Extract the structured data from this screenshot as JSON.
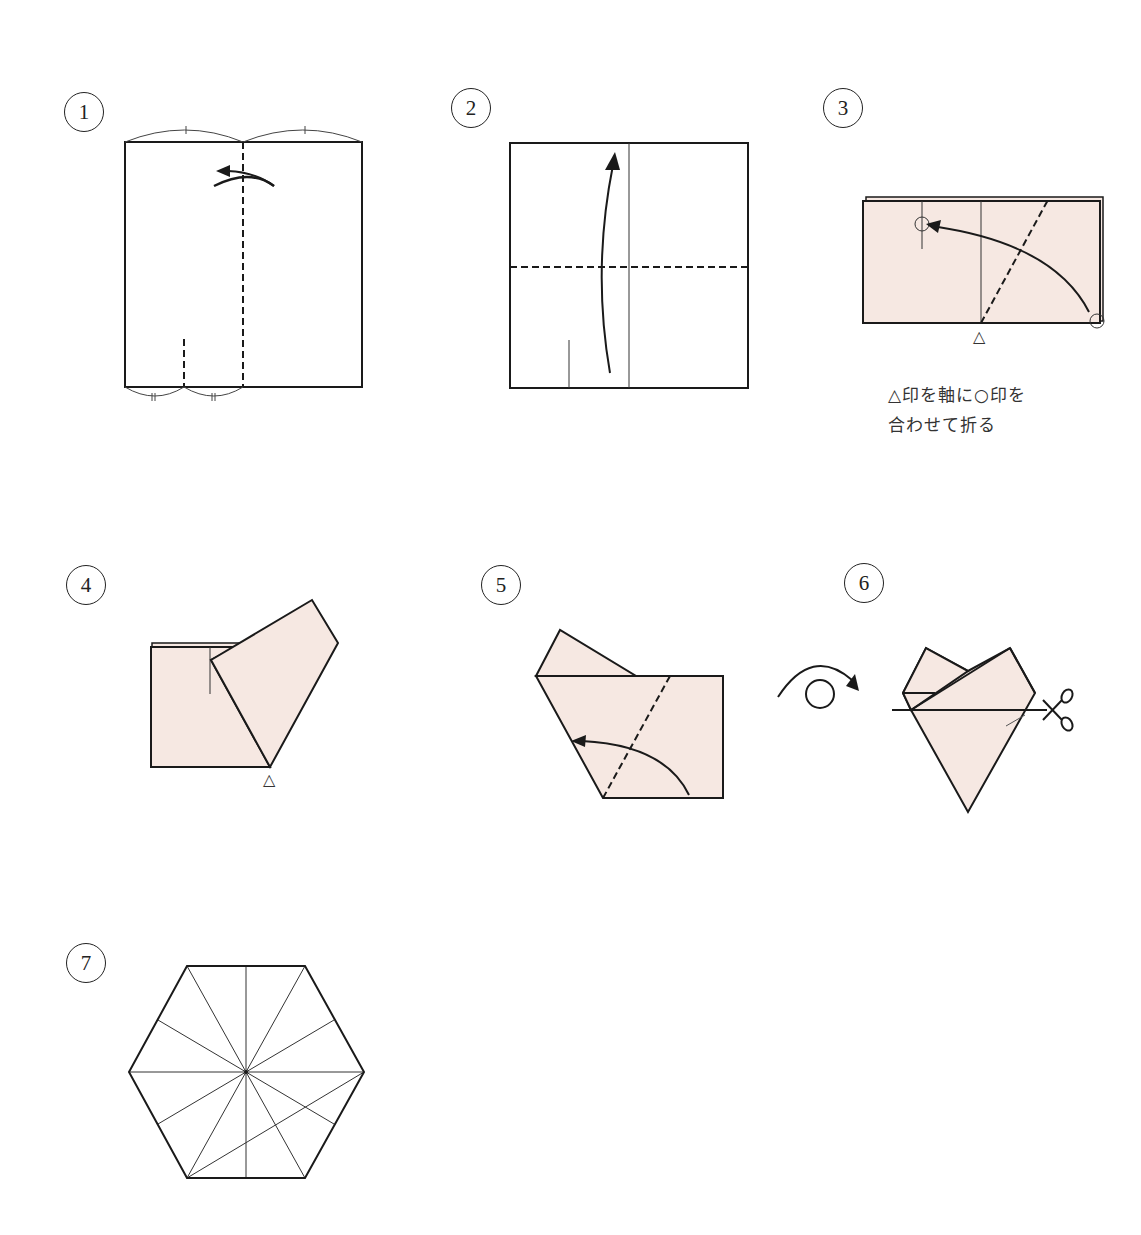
{
  "diagram": {
    "colors": {
      "paper_fill": "#f6e8e2",
      "line": "#1a1a1a",
      "background": "#ffffff"
    },
    "steps": [
      {
        "number": "1",
        "description": "Square with vertical valley-fold at center; fold right half to left. Top marks show equal halves; bottom marks show equal quarters (pinch mark)."
      },
      {
        "number": "2",
        "description": "Unfolded square with vertical crease and short pinch mark at bottom; fold bottom edge up along horizontal dashed line."
      },
      {
        "number": "3",
        "description": "Folded rectangle (pink); fold along diagonal dashed line pivoting at △ so that bottom-right ○ meets left crease ○.",
        "caption_line1": "△印を軸に○印を",
        "caption_line2": "合わせて折る",
        "pivot_mark": "△"
      },
      {
        "number": "4",
        "description": "Result of step 3: flap folded up-left from pivot △.",
        "pivot_mark": "△"
      },
      {
        "number": "5",
        "description": "Fold right portion over along dashed line toward the left edge."
      },
      {
        "number": "6",
        "description": "Turn over; cut along horizontal line with scissors.",
        "icons": [
          "turn-over-icon",
          "scissors-icon"
        ]
      },
      {
        "number": "7",
        "description": "Unfold to get a regular hexagon with radial creases."
      }
    ]
  }
}
